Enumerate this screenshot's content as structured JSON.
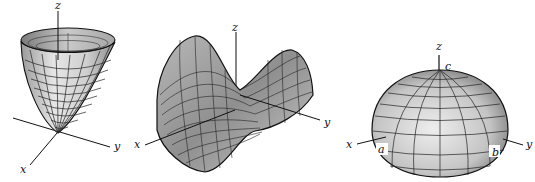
{
  "figures": [
    {
      "name": "elliptic-paraboloid",
      "axis_labels": {
        "z": "z",
        "x": "x",
        "y": "y"
      }
    },
    {
      "name": "hyperbolic-paraboloid",
      "axis_labels": {
        "z": "z",
        "x": "x",
        "y": "y"
      }
    },
    {
      "name": "ellipsoid",
      "axis_labels": {
        "z": "z",
        "x": "x",
        "y": "y"
      },
      "intercept_labels": {
        "a": "a",
        "b": "b",
        "c": "c"
      }
    }
  ],
  "colors": {
    "ink": "#111111",
    "surface_light": "#d8d8d8",
    "surface_dark": "#8a8a8a",
    "background": "#ffffff"
  }
}
